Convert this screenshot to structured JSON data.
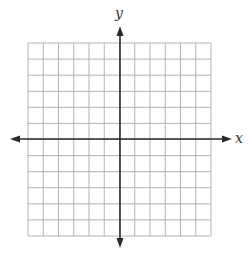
{
  "diagram": {
    "type": "coordinate-plane",
    "grid": {
      "columns": 12,
      "rows": 12,
      "color": "#b4b4b4"
    },
    "axes": {
      "color": "#2a2a2a",
      "x_label": "x",
      "y_label": "y",
      "x_arrows": "both",
      "y_arrows": "both"
    },
    "origin_cell": {
      "col": 6,
      "row": 6
    }
  }
}
